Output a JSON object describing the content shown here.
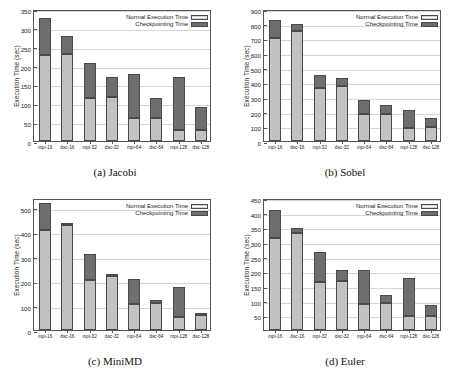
{
  "figure": {
    "legend": {
      "normal_label": "Normal Execution Time",
      "checkpointing_label": "Checkpointing Time",
      "normal_color": "#c2c2c2",
      "checkpointing_color": "#6e6e6e"
    },
    "axis_label_y": "Execution Time (sec)",
    "categories": [
      "mpi-16",
      "dsc-16",
      "mpi-32",
      "dsc-32",
      "mpi-64",
      "dsc-64",
      "mpi-128",
      "dsc-128"
    ]
  },
  "chart_data": [
    {
      "type": "bar",
      "id": "jacobi",
      "title": "(a) Jacobi",
      "caption": "(a) Jacobi",
      "xlabel": "",
      "ylabel": "Execution Time (sec)",
      "ylim": [
        0,
        350
      ],
      "yticks": [
        0,
        50,
        100,
        150,
        200,
        250,
        300,
        350
      ],
      "ytick_labels": [
        "0",
        "50",
        "100",
        "150",
        "200",
        "250",
        "300",
        "350"
      ],
      "grid": true,
      "legend_position": "top-right",
      "stacked": true,
      "categories": [
        "mpi-16",
        "dsc-16",
        "mpi-32",
        "dsc-32",
        "mpi-64",
        "dsc-64",
        "mpi-128",
        "dsc-128"
      ],
      "series": [
        {
          "name": "Normal Execution Time",
          "values": [
            228,
            230,
            115,
            116,
            60,
            60,
            29,
            29
          ]
        },
        {
          "name": "Checkpointing Time",
          "values": [
            97,
            48,
            92,
            53,
            119,
            55,
            140,
            62
          ]
        }
      ],
      "totals": [
        325,
        278,
        207,
        169,
        179,
        115,
        169,
        91
      ]
    },
    {
      "type": "bar",
      "id": "sobel",
      "title": "(b) Sobel",
      "caption": "(b) Sobel",
      "xlabel": "",
      "ylabel": "Execution Time (sec)",
      "ylim": [
        0,
        900
      ],
      "yticks": [
        0,
        100,
        200,
        300,
        400,
        500,
        600,
        700,
        800,
        900
      ],
      "ytick_labels": [
        "0",
        "100",
        "200",
        "300",
        "400",
        "500",
        "600",
        "700",
        "800",
        "900"
      ],
      "grid": true,
      "legend_position": "top-right",
      "stacked": true,
      "categories": [
        "mpi-16",
        "dsc-16",
        "mpi-32",
        "dsc-32",
        "mpi-64",
        "dsc-64",
        "mpi-128",
        "dsc-128"
      ],
      "series": [
        {
          "name": "Normal Execution Time",
          "values": [
            705,
            748,
            360,
            372,
            185,
            185,
            92,
            97
          ]
        },
        {
          "name": "Checkpointing Time",
          "values": [
            118,
            52,
            92,
            58,
            95,
            60,
            120,
            58
          ]
        }
      ],
      "totals": [
        823,
        800,
        452,
        430,
        280,
        245,
        212,
        155
      ]
    },
    {
      "type": "bar",
      "id": "minimd",
      "title": "(c) MiniMD",
      "caption": "(c) MiniMD",
      "xlabel": "",
      "ylabel": "Execution Time (sec)",
      "ylim": [
        0,
        540
      ],
      "yticks": [
        0,
        100,
        200,
        300,
        400,
        500
      ],
      "ytick_labels": [
        "0",
        "100",
        "200",
        "300",
        "400",
        "500"
      ],
      "grid": true,
      "legend_position": "top-right",
      "stacked": true,
      "categories": [
        "mpi-16",
        "dsc-16",
        "mpi-32",
        "dsc-32",
        "mpi-64",
        "dsc-64",
        "mpi-128",
        "dsc-128"
      ],
      "series": [
        {
          "name": "Normal Execution Time",
          "values": [
            410,
            428,
            203,
            220,
            105,
            112,
            55,
            60
          ]
        },
        {
          "name": "Checkpointing Time",
          "values": [
            108,
            9,
            107,
            6,
            105,
            9,
            121,
            8
          ]
        }
      ],
      "totals": [
        518,
        437,
        310,
        226,
        210,
        121,
        176,
        68
      ]
    },
    {
      "type": "bar",
      "id": "euler",
      "title": "(d) Euler",
      "caption": "(d) Euler",
      "xlabel": "",
      "ylabel": "Execution Time (sec)",
      "ylim": [
        0,
        450
      ],
      "yticks": [
        50,
        100,
        150,
        200,
        250,
        300,
        350,
        400,
        450
      ],
      "ytick_labels": [
        "50",
        "100",
        "150",
        "200",
        "250",
        "300",
        "350",
        "400",
        "450"
      ],
      "grid": true,
      "legend_position": "top-right",
      "stacked": true,
      "categories": [
        "mpi-16",
        "dsc-16",
        "mpi-32",
        "dsc-32",
        "mpi-64",
        "dsc-64",
        "mpi-128",
        "dsc-128"
      ],
      "series": [
        {
          "name": "Normal Execution Time",
          "values": [
            315,
            331,
            164,
            168,
            88,
            91,
            49,
            49
          ]
        },
        {
          "name": "Checkpointing Time",
          "values": [
            93,
            18,
            103,
            35,
            118,
            28,
            130,
            35
          ]
        }
      ],
      "totals": [
        408,
        349,
        267,
        203,
        206,
        119,
        179,
        84
      ]
    }
  ]
}
